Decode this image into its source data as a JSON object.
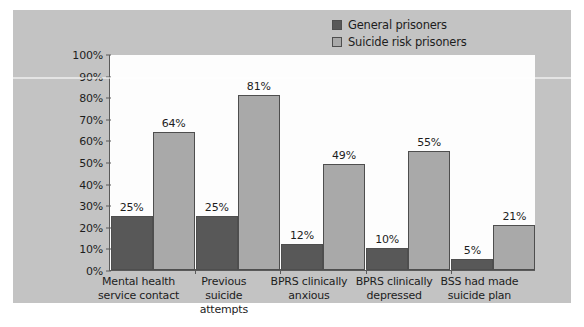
{
  "chart_data": {
    "type": "bar",
    "title": "",
    "subtitle": "",
    "xlabel": "",
    "ylabel": "",
    "ylim": [
      0,
      100
    ],
    "y_tick_labels": [
      "0%",
      "10%",
      "20%",
      "30%",
      "40%",
      "50%",
      "60%",
      "70%",
      "80%",
      "90%",
      "100%"
    ],
    "y_tick_values": [
      0,
      10,
      20,
      30,
      40,
      50,
      60,
      70,
      80,
      90,
      100
    ],
    "grid": false,
    "legend_position": "top-right",
    "categories": [
      "Mental health service contact",
      "Previous suicide attempts",
      "BPRS clinically anxious",
      "BPRS clinically depressed",
      "BSS had made suicide plan"
    ],
    "category_lines": [
      [
        "Mental health",
        "service contact"
      ],
      [
        "Previous suicide",
        "attempts"
      ],
      [
        "BPRS clinically",
        "anxious"
      ],
      [
        "BPRS clinically",
        "depressed"
      ],
      [
        "BSS had made",
        "suicide plan"
      ]
    ],
    "series": [
      {
        "name": "General prisoners",
        "color": "#585858",
        "values": [
          25,
          25,
          12,
          10,
          5
        ],
        "value_labels": [
          "25%",
          "25%",
          "12%",
          "10%",
          "5%"
        ]
      },
      {
        "name": "Suicide risk prisoners",
        "color": "#a9a9a9",
        "values": [
          64,
          81,
          49,
          55,
          21
        ],
        "value_labels": [
          "64%",
          "81%",
          "49%",
          "55%",
          "21%"
        ]
      }
    ]
  },
  "legend": {
    "items": [
      {
        "label": "General prisoners",
        "color": "#585858"
      },
      {
        "label": "Suicide risk prisoners",
        "color": "#a9a9a9"
      }
    ]
  },
  "figure": {
    "panel_color": "#c3c3c3",
    "plot_background": "#fdfdfd",
    "axis_color": "#5a5a5a",
    "text_color": "#1d1d1d",
    "caption_partial": ""
  }
}
